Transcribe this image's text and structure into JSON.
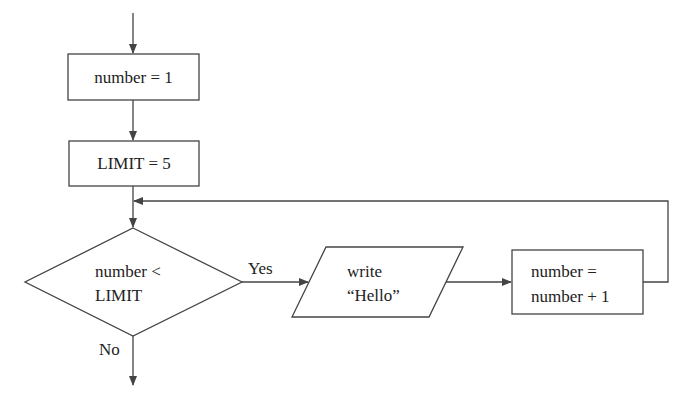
{
  "flowchart": {
    "nodes": [
      {
        "id": "init",
        "type": "process",
        "text": "number = 1"
      },
      {
        "id": "limit",
        "type": "process",
        "text": "LIMIT = 5"
      },
      {
        "id": "cond",
        "type": "decision",
        "lines": [
          "number <",
          "LIMIT"
        ]
      },
      {
        "id": "write",
        "type": "io",
        "lines": [
          "write",
          "“Hello”"
        ]
      },
      {
        "id": "incr",
        "type": "process",
        "lines": [
          "number =",
          "number + 1"
        ]
      }
    ],
    "edges": {
      "yes_label": "Yes",
      "no_label": "No"
    }
  },
  "colors": {
    "stroke": "#444444",
    "background": "#ffffff"
  }
}
